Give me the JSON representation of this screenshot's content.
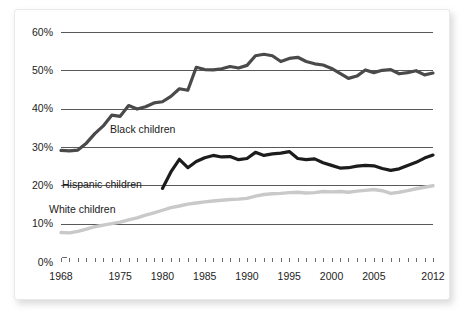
{
  "chart_data": {
    "type": "line",
    "title": "",
    "subtitle": "",
    "xlabel": "",
    "ylabel": "",
    "xlim": [
      1968,
      2012
    ],
    "ylim": [
      0,
      60
    ],
    "grid": true,
    "legend_position": "inline-labels",
    "y_tick_labels": [
      "0%",
      "10%",
      "20%",
      "30%",
      "40%",
      "50%",
      "60%"
    ],
    "y_tick_values": [
      0,
      10,
      20,
      30,
      40,
      50,
      60
    ],
    "x_tick_labels": [
      "1968",
      "1975",
      "1980",
      "1985",
      "1990",
      "1995",
      "2000",
      "2005",
      "2012"
    ],
    "x_tick_values": [
      1968,
      1975,
      1980,
      1985,
      1990,
      1995,
      2000,
      2005,
      2012
    ],
    "x_minor_ticks": [
      1968,
      1969,
      1970,
      1971,
      1972,
      1973,
      1974,
      1975,
      1976,
      1977,
      1978,
      1979,
      1980,
      1981,
      1982,
      1983,
      1984,
      1985,
      1986,
      1987,
      1988,
      1989,
      1990,
      1991,
      1992,
      1993,
      1994,
      1995,
      1996,
      1997,
      1998,
      1999,
      2000,
      2001,
      2002,
      2003,
      2004,
      2005,
      2006,
      2007,
      2008,
      2009,
      2010,
      2011,
      2012
    ],
    "colors": {
      "black_children": "#4a4a4a",
      "hispanic_children": "#1c1c1c",
      "white_children": "#c9c9c9",
      "gridline": "#595959",
      "text": "#232323"
    },
    "series": [
      {
        "name": "Black children",
        "label": "Black children",
        "color": "#4a4a4a",
        "width": 3.2,
        "x": [
          1968,
          1969,
          1970,
          1971,
          1972,
          1973,
          1974,
          1975,
          1976,
          1977,
          1978,
          1979,
          1980,
          1981,
          1982,
          1983,
          1984,
          1985,
          1986,
          1987,
          1988,
          1989,
          1990,
          1991,
          1992,
          1993,
          1994,
          1995,
          1996,
          1997,
          1998,
          1999,
          2000,
          2001,
          2002,
          2003,
          2004,
          2005,
          2006,
          2007,
          2008,
          2009,
          2010,
          2011,
          2012
        ],
        "values": [
          29.1,
          29.0,
          29.2,
          31.0,
          33.5,
          35.5,
          38.3,
          38.0,
          40.8,
          39.9,
          40.5,
          41.5,
          41.8,
          43.2,
          45.2,
          44.8,
          50.8,
          50.2,
          50.1,
          50.4,
          51.0,
          50.6,
          51.3,
          53.8,
          54.2,
          53.8,
          52.3,
          53.1,
          53.4,
          52.3,
          51.7,
          51.4,
          50.5,
          49.2,
          47.9,
          48.5,
          50.1,
          49.4,
          50.0,
          50.2,
          49.1,
          49.4,
          49.9,
          48.8,
          49.3
        ]
      },
      {
        "name": "Hispanic children",
        "label": "Hispanic children",
        "color": "#1c1c1c",
        "width": 3.2,
        "x": [
          1980,
          1981,
          1982,
          1983,
          1984,
          1985,
          1986,
          1987,
          1988,
          1989,
          1990,
          1991,
          1992,
          1993,
          1994,
          1995,
          1996,
          1997,
          1998,
          1999,
          2000,
          2001,
          2002,
          2003,
          2004,
          2005,
          2006,
          2007,
          2008,
          2009,
          2010,
          2011,
          2012
        ],
        "values": [
          19.2,
          23.5,
          26.8,
          24.6,
          26.2,
          27.2,
          27.8,
          27.4,
          27.5,
          26.7,
          27.0,
          28.6,
          27.8,
          28.2,
          28.4,
          28.8,
          27.0,
          26.7,
          26.9,
          25.9,
          25.2,
          24.5,
          24.6,
          25.0,
          25.2,
          25.1,
          24.4,
          23.9,
          24.3,
          25.2,
          26.0,
          27.1,
          27.9
        ]
      },
      {
        "name": "White children",
        "label": "White children",
        "color": "#c9c9c9",
        "width": 3.4,
        "x": [
          1968,
          1969,
          1970,
          1971,
          1972,
          1973,
          1974,
          1975,
          1976,
          1977,
          1978,
          1979,
          1980,
          1981,
          1982,
          1983,
          1984,
          1985,
          1986,
          1987,
          1988,
          1989,
          1990,
          1991,
          1992,
          1993,
          1994,
          1995,
          1996,
          1997,
          1998,
          1999,
          2000,
          2001,
          2002,
          2003,
          2004,
          2005,
          2006,
          2007,
          2008,
          2009,
          2010,
          2011,
          2012
        ],
        "values": [
          7.7,
          7.6,
          8.0,
          8.6,
          9.2,
          9.6,
          10.0,
          10.4,
          11.0,
          11.5,
          12.2,
          12.8,
          13.5,
          14.2,
          14.6,
          15.1,
          15.4,
          15.7,
          15.9,
          16.1,
          16.3,
          16.4,
          16.6,
          17.2,
          17.6,
          17.8,
          17.9,
          18.1,
          18.2,
          18.0,
          18.1,
          18.4,
          18.3,
          18.4,
          18.2,
          18.5,
          18.7,
          18.9,
          18.6,
          17.9,
          18.2,
          18.6,
          19.1,
          19.5,
          19.9
        ]
      }
    ]
  },
  "labels": {
    "black": "Black children",
    "hispanic": "Hispanic children",
    "white": "White children"
  }
}
